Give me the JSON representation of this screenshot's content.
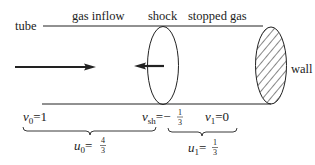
{
  "labels": {
    "tube": "tube",
    "gas_inflow": "gas inflow",
    "shock": "shock",
    "stopped_gas": "stopped gas",
    "wall": "wall"
  },
  "equations": {
    "v0": {
      "var": "v",
      "sub": "0",
      "eq": "=1"
    },
    "vsh": {
      "var": "v",
      "sub": "sh",
      "eq": "=−",
      "num": "1",
      "den": "3"
    },
    "v1": {
      "var": "v",
      "sub": "1",
      "eq": "=0"
    },
    "u0": {
      "var": "u",
      "sub": "0",
      "eq": "=",
      "num": "4",
      "den": "3"
    },
    "u1": {
      "var": "u",
      "sub": "1",
      "eq": "=",
      "num": "1",
      "den": "3"
    }
  },
  "colors": {
    "stroke": "#222222",
    "background": "#ffffff"
  }
}
